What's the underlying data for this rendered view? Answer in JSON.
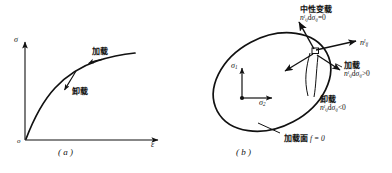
{
  "figure": {
    "panel_a": {
      "caption": "( a )",
      "y_axis_label": "σ",
      "x_axis_label": "ε",
      "origin_label": "o",
      "curve_labels": [
        {
          "name": "loading",
          "text": "加载"
        },
        {
          "name": "unloading",
          "text": "卸载"
        }
      ]
    },
    "panel_b": {
      "caption": "( b )",
      "axis_sigma1": "σ",
      "axis_sigma1_sub": "1",
      "axis_sigma2": "σ",
      "axis_sigma2_sub": "2",
      "normal_vector": {
        "base": "n",
        "sup": "l",
        "sub": "ij"
      },
      "annotations": [
        {
          "name": "neutral-loading",
          "title": "中性变载",
          "formula_base": "n",
          "formula_sup": "l",
          "formula_sub": "ij",
          "formula_d": "d",
          "formula_sigma": "σ",
          "formula_sigma_sub": "ij",
          "formula_rel": "=0"
        },
        {
          "name": "loading",
          "title": "加载",
          "formula_base": "n",
          "formula_sup": "l",
          "formula_sub": "ij",
          "formula_d": "d",
          "formula_sigma": "σ",
          "formula_sigma_sub": "ij",
          "formula_rel": ">0"
        },
        {
          "name": "unloading",
          "title": "卸载",
          "formula_base": "n",
          "formula_sup": "l",
          "formula_sub": "ij",
          "formula_d": "d",
          "formula_sigma": "σ",
          "formula_sigma_sub": "ij",
          "formula_rel": "<0"
        }
      ],
      "yield_surface": {
        "title": "加载面",
        "formula": "f = 0"
      }
    },
    "colors": {
      "ink": "#111111",
      "background": "#ffffff"
    }
  }
}
